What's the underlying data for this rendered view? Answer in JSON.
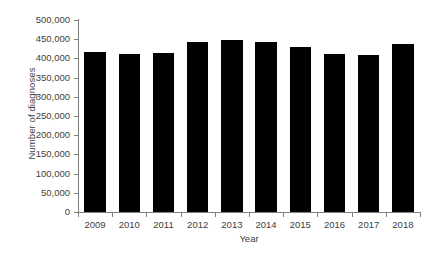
{
  "chart_data": {
    "type": "bar",
    "title": "",
    "xlabel": "Year",
    "ylabel": "Number of diagnoses",
    "categories": [
      "2009",
      "2010",
      "2011",
      "2012",
      "2013",
      "2014",
      "2015",
      "2016",
      "2017",
      "2018"
    ],
    "values": [
      418000,
      412000,
      415000,
      444000,
      447000,
      444000,
      430000,
      412000,
      410000,
      437000
    ],
    "ylim": [
      0,
      500000
    ],
    "ytick_values": [
      0,
      50000,
      100000,
      150000,
      200000,
      250000,
      300000,
      350000,
      400000,
      450000,
      500000
    ],
    "ytick_labels": [
      "0",
      "50,000",
      "100,000",
      "150,000",
      "200,000",
      "250,000",
      "300,000",
      "350,000",
      "400,000",
      "450,000",
      "500,000"
    ],
    "grid": false,
    "legend": null,
    "bar_color": "#000000",
    "axis_color": "#7f7f7f",
    "text_color": "#404040"
  }
}
